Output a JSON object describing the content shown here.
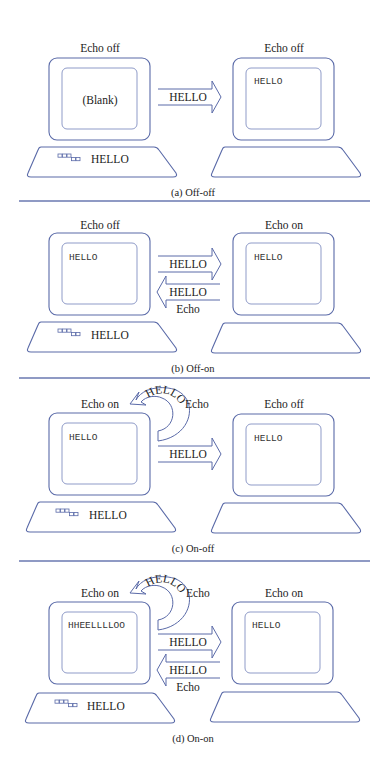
{
  "colors": {
    "line": "#5a6aa8",
    "screen": "#8f9bc8",
    "text": "#222222"
  },
  "panels": [
    {
      "caption": "(a) Off-off",
      "left": {
        "label": "Echo off",
        "screen_text": "(Blank)",
        "screen_mono": false,
        "keyboard_text": "HELLO"
      },
      "right": {
        "label": "Echo off",
        "screen_text": "HELLO"
      },
      "forward_arrow": "HELLO",
      "back_arrow": null,
      "local_echo": null
    },
    {
      "caption": "(b) Off-on",
      "left": {
        "label": "Echo off",
        "screen_text": "HELLO",
        "screen_mono": true,
        "keyboard_text": "HELLO"
      },
      "right": {
        "label": "Echo on",
        "screen_text": "HELLO"
      },
      "forward_arrow": "HELLO",
      "back_arrow": {
        "text": "HELLO",
        "sublabel": "Echo"
      },
      "local_echo": null
    },
    {
      "caption": "(c) On-off",
      "left": {
        "label": "Echo on",
        "screen_text": "HELLO",
        "screen_mono": true,
        "keyboard_text": "HELLO"
      },
      "right": {
        "label": "Echo off",
        "screen_text": "HELLO"
      },
      "forward_arrow": "HELLO",
      "back_arrow": null,
      "local_echo": {
        "text": "HELLO",
        "label": "Echo"
      }
    },
    {
      "caption": "(d) On-on",
      "left": {
        "label": "Echo on",
        "screen_text": "HHEELLLLOO",
        "screen_mono": true,
        "keyboard_text": "HELLO"
      },
      "right": {
        "label": "Echo on",
        "screen_text": "HELLO"
      },
      "forward_arrow": "HELLO",
      "back_arrow": {
        "text": "HELLO",
        "sublabel": "Echo"
      },
      "local_echo": {
        "text": "HELLO",
        "label": "Echo"
      }
    }
  ]
}
